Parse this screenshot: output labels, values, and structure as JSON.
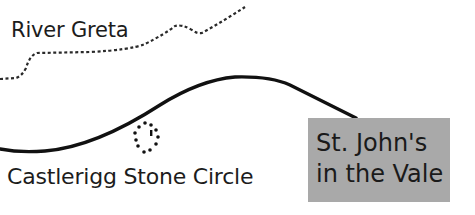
{
  "map": {
    "labels": {
      "river": "River Greta",
      "stone_circle": "Castlerigg Stone Circle",
      "destination_line1": "St. John's",
      "destination_line2": "in the Vale"
    },
    "colors": {
      "background": "#ffffff",
      "ink": "#1a1a1a",
      "destination_box": "#a9a9a9"
    },
    "features": [
      {
        "type": "river",
        "style": "dotted line",
        "name": "River Greta"
      },
      {
        "type": "road",
        "style": "solid thick line"
      },
      {
        "type": "stone-circle-symbol",
        "style": "ring of dots",
        "name": "Castlerigg Stone Circle"
      },
      {
        "type": "destination-box",
        "name": "St. John's in the Vale"
      }
    ]
  }
}
